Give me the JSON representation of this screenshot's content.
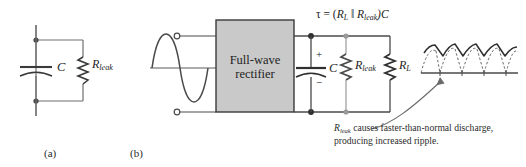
{
  "figure": {
    "title_a": "(a)",
    "title_b": "(b)",
    "panel_a": {
      "capacitor_label": "C",
      "resistor_label_main": "R",
      "resistor_label_sub": "leak"
    },
    "panel_b": {
      "block_line1": "Full-wave",
      "block_line2": "rectifier",
      "tau_prefix": "τ = (",
      "tau_rl_main": "R",
      "tau_rl_sub": "L",
      "tau_parallel": " ‖ ",
      "tau_rleak_main": "R",
      "tau_rleak_sub": "leak",
      "tau_suffix": ")C",
      "capacitor_label": "C",
      "capacitor_plus": "+",
      "capacitor_minus": "−",
      "rleak_main": "R",
      "rleak_sub": "leak",
      "rl_main": "R",
      "rl_sub": "L",
      "caption_line1_main": "R",
      "caption_line1_sub": "leak",
      "caption_line1_rest": " causes faster-than-normal discharge,",
      "caption_line2": "producing increased ripple."
    }
  },
  "colors": {
    "wire": "#4a4a4a",
    "wire_light": "#8a8a8a",
    "block_fill": "#c9c9c9",
    "block_stroke": "#3a3a3a",
    "waveform": "#4a4a4a",
    "text": "#232323",
    "node": "#3a3a3a"
  }
}
